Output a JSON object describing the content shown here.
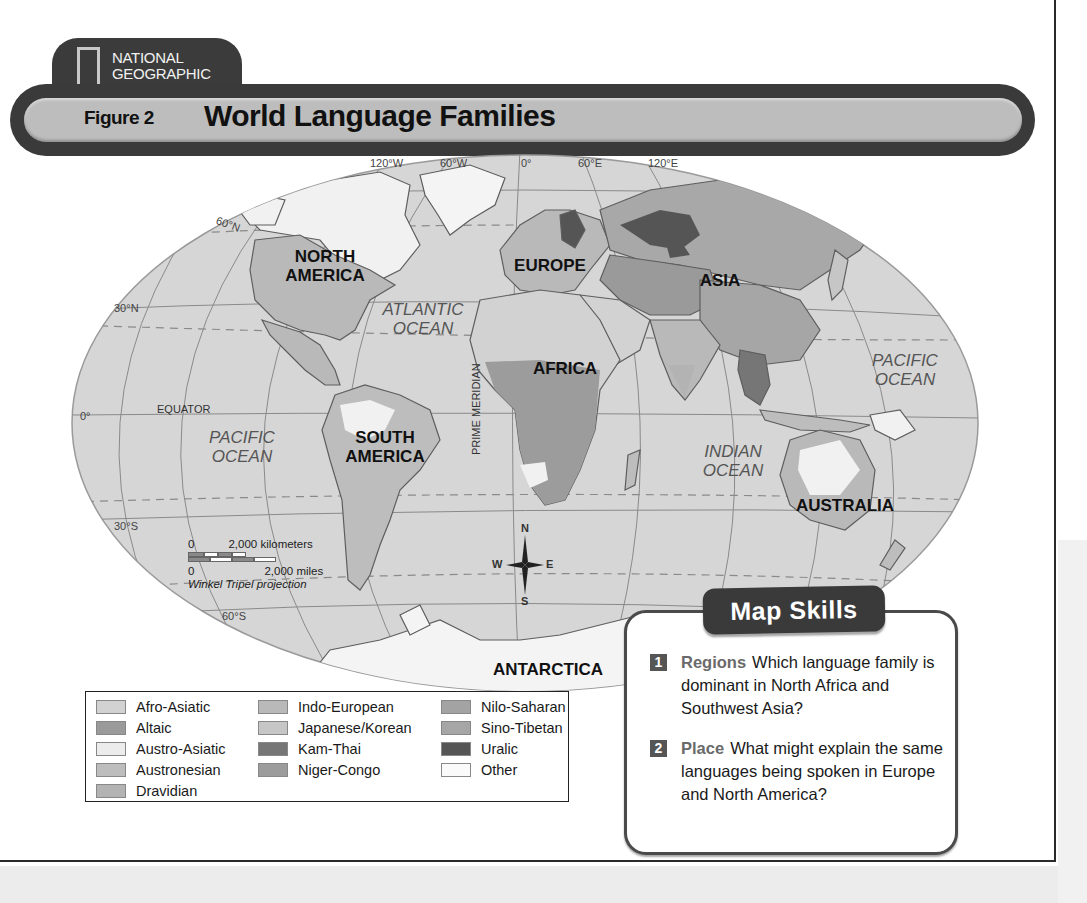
{
  "header": {
    "brand_line1": "NATIONAL",
    "brand_line2": "GEOGRAPHIC",
    "figure_label": "Figure 2",
    "title": "World Language Families"
  },
  "map": {
    "longitude_labels": [
      "120°W",
      "60°W",
      "0°",
      "60°E",
      "120°E"
    ],
    "latitude_labels": {
      "lat_60n": "60°N",
      "lat_30n": "30°N",
      "lat_0": "0°",
      "lat_30s": "30°S",
      "lat_60s": "60°S"
    },
    "equator_label": "EQUATOR",
    "prime_meridian_label": "PRIME MERIDIAN",
    "continents": {
      "north_america": "NORTH\nAMERICA",
      "south_america": "SOUTH\nAMERICA",
      "europe": "EUROPE",
      "africa": "AFRICA",
      "asia": "ASIA",
      "australia": "AUSTRALIA",
      "antarctica": "ANTARCTICA"
    },
    "oceans": {
      "atlantic": "ATLANTIC\nOCEAN",
      "pacific_west": "PACIFIC\nOCEAN",
      "pacific_east": "PACIFIC\nOCEAN",
      "indian": "INDIAN\nOCEAN"
    },
    "compass": {
      "n": "N",
      "s": "S",
      "e": "E",
      "w": "W"
    },
    "scale": {
      "km_zero": "0",
      "km_label": "2,000 kilometers",
      "mi_zero": "0",
      "mi_label": "2,000 miles",
      "projection": "Winkel Tripel projection"
    },
    "colors": {
      "ocean": "#d6d6d6",
      "land_outline": "#6e6e6e",
      "graticule": "#8a8a8a"
    }
  },
  "legend": {
    "items": [
      {
        "label": "Afro-Asiatic",
        "color": "#d2d2d2"
      },
      {
        "label": "Altaic",
        "color": "#9a9a9a"
      },
      {
        "label": "Austro-Asiatic",
        "color": "#ececec"
      },
      {
        "label": "Austronesian",
        "color": "#bdbdbd"
      },
      {
        "label": "Dravidian",
        "color": "#b3b3b3"
      },
      {
        "label": "Indo-European",
        "color": "#b9b9b9"
      },
      {
        "label": "Japanese/Korean",
        "color": "#c6c6c6"
      },
      {
        "label": "Kam-Thai",
        "color": "#767676"
      },
      {
        "label": "Niger-Congo",
        "color": "#9c9c9c"
      },
      {
        "label": "Nilo-Saharan",
        "color": "#a3a3a3"
      },
      {
        "label": "Sino-Tibetan",
        "color": "#a6a6a6"
      },
      {
        "label": "Uralic",
        "color": "#555555"
      },
      {
        "label": "Other",
        "color": "#fafafa"
      }
    ]
  },
  "map_skills": {
    "header": "Map Skills",
    "questions": [
      {
        "number": "1",
        "keyword": "Regions",
        "text": "Which language family is dominant in North Africa and Southwest Asia?"
      },
      {
        "number": "2",
        "keyword": "Place",
        "text": "What might explain the same languages being spoken in Europe and North America?"
      }
    ]
  }
}
